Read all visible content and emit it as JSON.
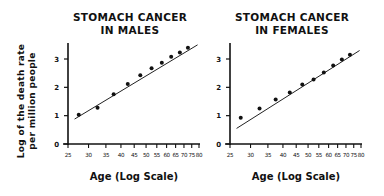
{
  "y_axis_label": [
    "Log of the death rate",
    "per million people"
  ],
  "chart_data": [
    {
      "type": "scatter",
      "title": "STOMACH CANCER IN MALES",
      "title_lines": [
        "STOMACH CANCER",
        "IN MALES"
      ],
      "xlabel": "Age (Log Scale)",
      "ylabel": "Log of the death rate per million people",
      "x_scale": "log",
      "xlim": [
        25,
        80
      ],
      "ylim": [
        0,
        3.6
      ],
      "x_ticks": [
        25,
        30,
        35,
        40,
        45,
        50,
        55,
        60,
        65,
        70,
        75,
        80
      ],
      "y_ticks": [
        0,
        1,
        2,
        3
      ],
      "x": [
        27.5,
        32.5,
        37.5,
        42.5,
        47.5,
        52.5,
        57.5,
        62.5,
        67.5,
        72.5
      ],
      "values": [
        1.03,
        1.28,
        1.76,
        2.12,
        2.43,
        2.67,
        2.87,
        3.08,
        3.23,
        3.4
      ],
      "trendline": {
        "x": [
          26.5,
          79
        ],
        "y": [
          0.88,
          3.5
        ]
      },
      "grid": false
    },
    {
      "type": "scatter",
      "title": "STOMACH CANCER IN FEMALES",
      "title_lines": [
        "STOMACH CANCER",
        "IN FEMALES"
      ],
      "xlabel": "Age (Log Scale)",
      "ylabel": "",
      "x_scale": "log",
      "xlim": [
        25,
        80
      ],
      "ylim": [
        0,
        3.6
      ],
      "x_ticks": [
        25,
        30,
        35,
        40,
        45,
        50,
        55,
        60,
        65,
        70,
        75,
        80
      ],
      "y_ticks": [
        0,
        1,
        2,
        3
      ],
      "x": [
        27.5,
        32.5,
        37.5,
        42.5,
        47.5,
        52.5,
        57.5,
        62.5,
        67.5,
        72.5
      ],
      "values": [
        0.93,
        1.25,
        1.57,
        1.82,
        2.1,
        2.28,
        2.52,
        2.77,
        2.98,
        3.15
      ],
      "trendline": {
        "x": [
          26.5,
          79
        ],
        "y": [
          0.55,
          3.3
        ]
      },
      "grid": false
    }
  ]
}
